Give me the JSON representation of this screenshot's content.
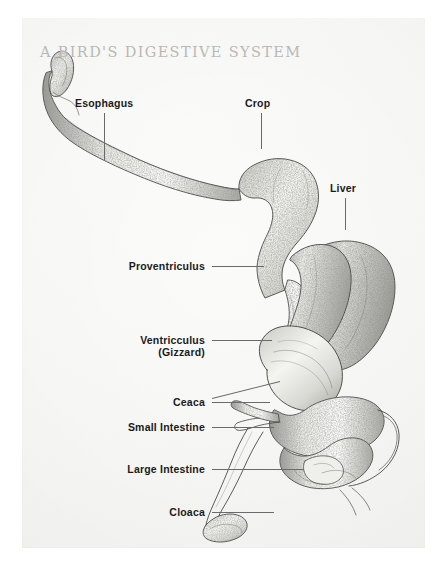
{
  "document": {
    "title": "A BIRD'S DIGESTIVE SYSTEM",
    "kind": "anatomical-illustration",
    "subject": "bird digestive tract",
    "background_color": "#f4f4f2",
    "title_color": "#b9b9b6",
    "label_color": "#1b1b1b",
    "leader_color": "#6a6a6a",
    "ink_color": "#4a4a48"
  },
  "labels": [
    {
      "id": "esophagus",
      "text": "Esophagus"
    },
    {
      "id": "crop",
      "text": "Crop"
    },
    {
      "id": "liver",
      "text": "Liver"
    },
    {
      "id": "proventriculus",
      "text": "Proventriculus"
    },
    {
      "id": "ventricculus",
      "text": "Ventricculus"
    },
    {
      "id": "gizzard",
      "text": "(Gizzard)"
    },
    {
      "id": "ceaca",
      "text": "Ceaca"
    },
    {
      "id": "small_intestine",
      "text": "Small Intestine"
    },
    {
      "id": "large_intestine",
      "text": "Large Intestine"
    },
    {
      "id": "cloaca",
      "text": "Cloaca"
    }
  ]
}
